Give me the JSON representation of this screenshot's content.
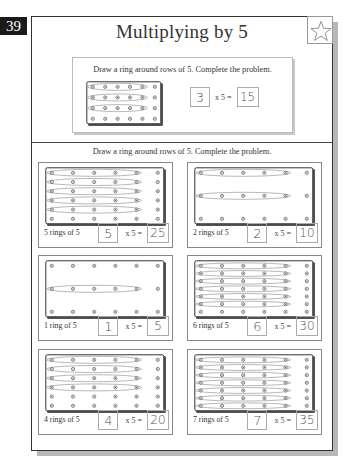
{
  "page": {
    "number": "39",
    "title": "Multiplying by 5"
  },
  "example": {
    "instruction": "Draw a ring around rows of 5. Complete the problem.",
    "grid": {
      "rows": 4,
      "cols": 6,
      "rings": 3
    },
    "factor": "3",
    "times": "x 5 =",
    "product": "15"
  },
  "section_instruction": "Draw a ring around rows of 5. Complete the problem.",
  "problems": [
    {
      "label": "5 rings of 5",
      "rows": 6,
      "rings": 5,
      "factor": "5",
      "times": "x 5 =",
      "product": "25"
    },
    {
      "label": "2 rings of 5",
      "rows": 3,
      "rings": 2,
      "factor": "2",
      "times": "x 5 =",
      "product": "10"
    },
    {
      "label": "1 ring of 5",
      "rows": 3,
      "rings": 1,
      "ring_offset": 1,
      "factor": "1",
      "times": "x 5 =",
      "product": "5"
    },
    {
      "label": "6 rings of 5",
      "rows": 7,
      "rings": 6,
      "factor": "6",
      "times": "x 5 =",
      "product": "30"
    },
    {
      "label": "4 rings of 5",
      "rows": 6,
      "rings": 4,
      "factor": "4",
      "times": "x 5 =",
      "product": "20"
    },
    {
      "label": "7 rings of 5",
      "rows": 7,
      "rings": 7,
      "factor": "7",
      "times": "x 5 =",
      "product": "35"
    }
  ],
  "colors": {
    "page_tab": "#1a1a1a",
    "frame": "#333333",
    "shadow": "#b8b8b8",
    "peg": "#666666"
  },
  "icons": {
    "star": "star-outline-icon"
  }
}
